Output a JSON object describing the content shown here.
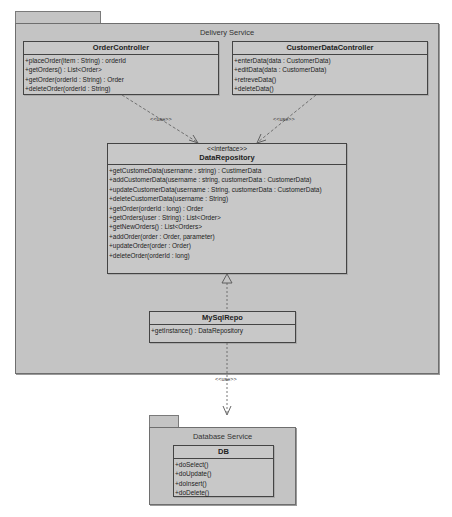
{
  "packages": {
    "delivery": {
      "title": "Delivery Service"
    },
    "database": {
      "title": "Database Service"
    }
  },
  "classes": {
    "order_controller": {
      "name": "OrderController",
      "operations": [
        "+placeOrder(item : String) : orderId",
        "+getOrders() : List<Order>",
        "+getOrder(orderId : String) : Order",
        "+deleteOrder(orderId : String)"
      ]
    },
    "customer_data_controller": {
      "name": "CustomerDataController",
      "operations": [
        "+enterData(data : CustomerData)",
        "+editData(data : CustomerData)",
        "+retreveData()",
        "+deleteData()"
      ]
    },
    "data_repository": {
      "stereotype": "<<interface>>",
      "name": "DataRepository",
      "operations": [
        "+getCustomeData(username : string) : CustimerData",
        "+addCustomerData(username : string, customerData : CustomerData)",
        "+updateCustomerData(username : String, customerData : CustomerData)",
        "+deleteCustomerData(username : String)",
        "+getOrder(orderId : long) : Order",
        "+getOrders(user : String) : List<Order>",
        "+getNewOrders() : List<Orders>",
        "+addOrder(order : Order, parameter)",
        "+updateOrder(order : Order)",
        "+deleteOrder(orderId : long)"
      ]
    },
    "mysql_repo": {
      "name": "MySqlRepo",
      "operations": [
        "+getInstance() : DataRepository"
      ]
    },
    "db": {
      "name": "DB",
      "operations": [
        "+doSelect()",
        "+doUpdate()",
        "+doInsert()",
        "+doDelete()"
      ]
    }
  },
  "relations": {
    "use_label": "<<use>>"
  },
  "colors": {
    "package_fill": "#c4c4c4",
    "class_fill": "#c8c8c8",
    "line": "#444444",
    "dashed_line": "#666666"
  }
}
